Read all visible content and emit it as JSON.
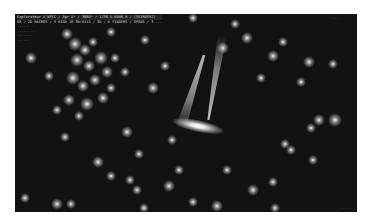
{
  "hud": {
    "title_line": "Explorateur A'NPIC / Sgr A* / 3880* / 1738.5.0006.0 / [SEIRDS92]",
    "info_line": "GR / 2D MACROS / 3 HIGH 1M 30/0115 / 3D / D FINDERS / OPENS / 3 ...",
    "sub_lines": [
      "......",
      "........",
      ".......",
      "......"
    ]
  },
  "top_right_label": "....",
  "corner_label": "......",
  "scene": {
    "object": "galaxy-with-jets",
    "background_color": "#121212",
    "stars": [
      {
        "x": 52,
        "y": 20,
        "r": 6
      },
      {
        "x": 60,
        "y": 30,
        "r": 7
      },
      {
        "x": 70,
        "y": 36,
        "r": 6
      },
      {
        "x": 78,
        "y": 28,
        "r": 5
      },
      {
        "x": 62,
        "y": 46,
        "r": 7
      },
      {
        "x": 74,
        "y": 52,
        "r": 6
      },
      {
        "x": 86,
        "y": 44,
        "r": 7
      },
      {
        "x": 92,
        "y": 58,
        "r": 6
      },
      {
        "x": 58,
        "y": 64,
        "r": 7
      },
      {
        "x": 68,
        "y": 72,
        "r": 6
      },
      {
        "x": 80,
        "y": 66,
        "r": 6
      },
      {
        "x": 96,
        "y": 74,
        "r": 5
      },
      {
        "x": 54,
        "y": 86,
        "r": 6
      },
      {
        "x": 72,
        "y": 90,
        "r": 7
      },
      {
        "x": 88,
        "y": 84,
        "r": 6
      },
      {
        "x": 64,
        "y": 102,
        "r": 5
      },
      {
        "x": 100,
        "y": 44,
        "r": 5
      },
      {
        "x": 110,
        "y": 58,
        "r": 5
      },
      {
        "x": 34,
        "y": 62,
        "r": 5
      },
      {
        "x": 42,
        "y": 96,
        "r": 5
      },
      {
        "x": 16,
        "y": 44,
        "r": 6
      },
      {
        "x": 96,
        "y": 18,
        "r": 5
      },
      {
        "x": 130,
        "y": 26,
        "r": 5
      },
      {
        "x": 138,
        "y": 74,
        "r": 6
      },
      {
        "x": 150,
        "y": 52,
        "r": 5
      },
      {
        "x": 208,
        "y": 34,
        "r": 6
      },
      {
        "x": 232,
        "y": 24,
        "r": 6
      },
      {
        "x": 268,
        "y": 28,
        "r": 5
      },
      {
        "x": 258,
        "y": 42,
        "r": 6
      },
      {
        "x": 294,
        "y": 48,
        "r": 6
      },
      {
        "x": 246,
        "y": 64,
        "r": 5
      },
      {
        "x": 286,
        "y": 68,
        "r": 5
      },
      {
        "x": 318,
        "y": 50,
        "r": 5
      },
      {
        "x": 304,
        "y": 106,
        "r": 6
      },
      {
        "x": 320,
        "y": 106,
        "r": 7
      },
      {
        "x": 296,
        "y": 114,
        "r": 5
      },
      {
        "x": 270,
        "y": 130,
        "r": 5
      },
      {
        "x": 276,
        "y": 136,
        "r": 5
      },
      {
        "x": 298,
        "y": 146,
        "r": 5
      },
      {
        "x": 238,
        "y": 176,
        "r": 6
      },
      {
        "x": 258,
        "y": 168,
        "r": 5
      },
      {
        "x": 212,
        "y": 156,
        "r": 5
      },
      {
        "x": 157,
        "y": 126,
        "r": 5
      },
      {
        "x": 164,
        "y": 156,
        "r": 5
      },
      {
        "x": 112,
        "y": 118,
        "r": 6
      },
      {
        "x": 124,
        "y": 140,
        "r": 5
      },
      {
        "x": 115,
        "y": 166,
        "r": 5
      },
      {
        "x": 122,
        "y": 176,
        "r": 5
      },
      {
        "x": 50,
        "y": 123,
        "r": 5
      },
      {
        "x": 83,
        "y": 148,
        "r": 6
      },
      {
        "x": 96,
        "y": 162,
        "r": 5
      },
      {
        "x": 10,
        "y": 184,
        "r": 5
      },
      {
        "x": 42,
        "y": 190,
        "r": 6
      },
      {
        "x": 56,
        "y": 190,
        "r": 5
      },
      {
        "x": 129,
        "y": 194,
        "r": 5
      },
      {
        "x": 154,
        "y": 172,
        "r": 6
      },
      {
        "x": 178,
        "y": 188,
        "r": 5
      },
      {
        "x": 202,
        "y": 192,
        "r": 6
      },
      {
        "x": 260,
        "y": 194,
        "r": 5
      },
      {
        "x": 178,
        "y": 4,
        "r": 5
      },
      {
        "x": 220,
        "y": 10,
        "r": 5
      }
    ]
  }
}
